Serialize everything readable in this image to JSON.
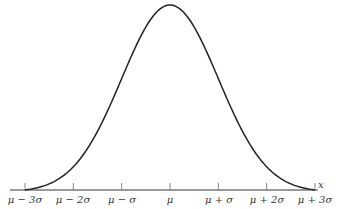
{
  "chart_data": {
    "type": "line",
    "title": "",
    "xlabel": "x",
    "ylabel": "",
    "categories": [
      "μ − 3σ",
      "μ − 2σ",
      "μ − σ",
      "μ",
      "μ + σ",
      "μ + 2σ",
      "μ + 3σ"
    ],
    "x": [
      -3,
      -2,
      -1,
      0,
      1,
      2,
      3
    ],
    "values": [
      0.0044,
      0.054,
      0.242,
      0.399,
      0.242,
      0.054,
      0.0044
    ],
    "xlim": [
      -3,
      3
    ],
    "grid": false,
    "legend": null
  },
  "axis": {
    "x_label": "x",
    "ticks": [
      "μ − 3σ",
      "μ − 2σ",
      "μ − σ",
      "μ",
      "μ + σ",
      "μ + 2σ",
      "μ + 3σ"
    ]
  }
}
